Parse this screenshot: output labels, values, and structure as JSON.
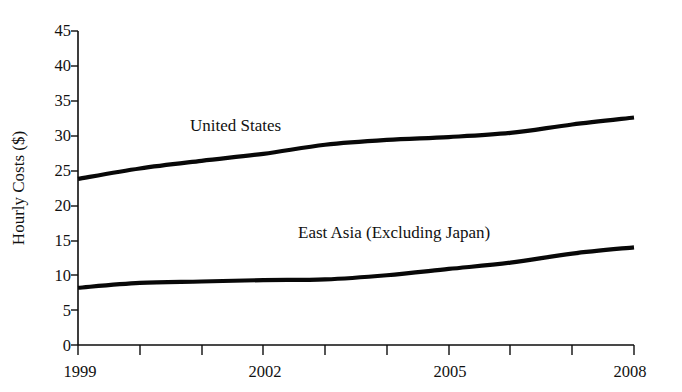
{
  "chart_data": {
    "type": "line",
    "title": "",
    "xlabel": "",
    "ylabel": "Hourly Costs ($)",
    "xlim": [
      1999,
      2008
    ],
    "ylim": [
      0,
      45
    ],
    "grid": false,
    "legend_position": "inline-labels",
    "x": [
      1999,
      2000,
      2001,
      2002,
      2003,
      2004,
      2005,
      2006,
      2007,
      2008
    ],
    "xticks": [
      1999,
      2000,
      2001,
      2002,
      2003,
      2004,
      2005,
      2006,
      2007,
      2008
    ],
    "xtick_labels": [
      "1999",
      "",
      "",
      "2002",
      "",
      "",
      "2005",
      "",
      "",
      "2008"
    ],
    "yticks": [
      0,
      5,
      10,
      15,
      20,
      25,
      30,
      35,
      40,
      45
    ],
    "ytick_labels": [
      "0",
      "5",
      "10",
      "15",
      "20",
      "25",
      "30",
      "35",
      "40",
      "45"
    ],
    "series": [
      {
        "name": "United States",
        "label_x": 2002,
        "label_y": 31.3,
        "color": "#080808",
        "values": [
          23.8,
          25.3,
          26.4,
          27.4,
          28.7,
          29.4,
          29.8,
          30.4,
          31.6,
          32.6
        ]
      },
      {
        "name": "East Asia (Excluding Japan)",
        "label_x": 2004.6,
        "label_y": 17.2,
        "color": "#080808",
        "values": [
          8.2,
          8.9,
          9.1,
          9.3,
          9.4,
          10.0,
          10.9,
          11.8,
          13.1,
          14.0
        ]
      }
    ]
  },
  "axis": {
    "y_title": "Hourly Costs ($)"
  }
}
